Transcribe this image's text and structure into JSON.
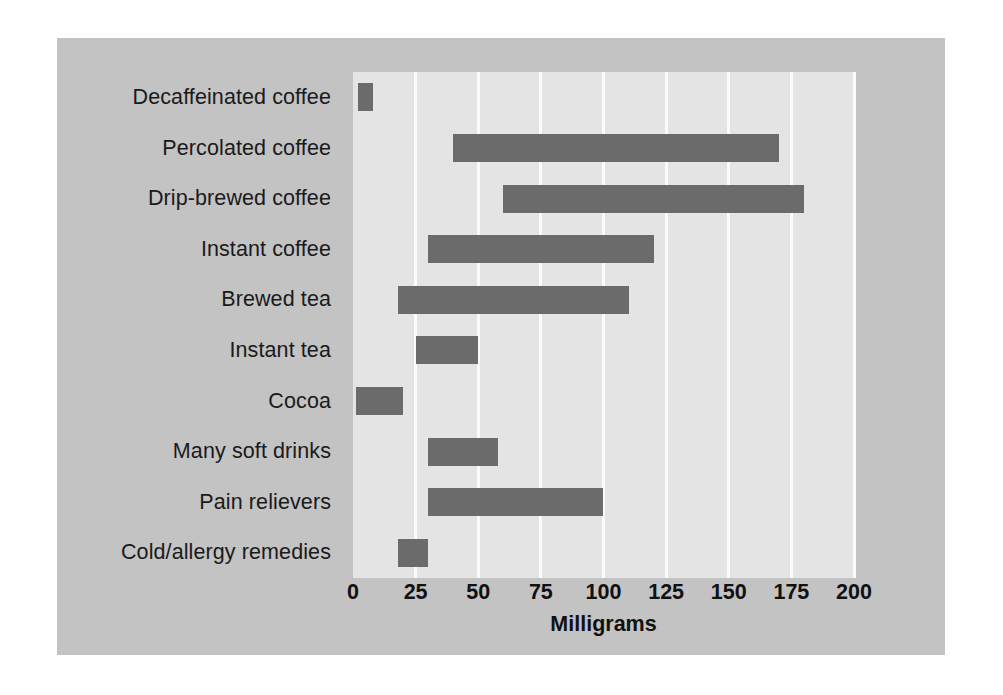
{
  "chart_data": {
    "type": "bar",
    "orientation": "horizontal",
    "bar_style": "range",
    "title": "",
    "xlabel": "Milligrams",
    "ylabel": "",
    "xlim": [
      0,
      200
    ],
    "xticks": [
      0,
      25,
      50,
      75,
      100,
      125,
      150,
      175,
      200
    ],
    "xtick_labels": [
      "0",
      "25",
      "50",
      "75",
      "100",
      "125",
      "150",
      "175",
      "200"
    ],
    "grid": "vertical",
    "legend": "none",
    "categories": [
      "Decaffeinated coffee",
      "Percolated coffee",
      "Drip-brewed coffee",
      "Instant coffee",
      "Brewed tea",
      "Instant tea",
      "Cocoa",
      "Many soft drinks",
      "Pain relievers",
      "Cold/allergy remedies"
    ],
    "ranges": [
      {
        "label": "Decaffeinated coffee",
        "low": 2,
        "high": 8
      },
      {
        "label": "Percolated coffee",
        "low": 40,
        "high": 170
      },
      {
        "label": "Drip-brewed coffee",
        "low": 60,
        "high": 180
      },
      {
        "label": "Instant coffee",
        "low": 30,
        "high": 120
      },
      {
        "label": "Brewed tea",
        "low": 18,
        "high": 110
      },
      {
        "label": "Instant tea",
        "low": 25,
        "high": 50
      },
      {
        "label": "Cocoa",
        "low": 1,
        "high": 20
      },
      {
        "label": "Many soft drinks",
        "low": 30,
        "high": 58
      },
      {
        "label": "Pain relievers",
        "low": 30,
        "high": 100
      },
      {
        "label": "Cold/allergy remedies",
        "low": 18,
        "high": 30
      }
    ],
    "colors": {
      "bar": "#6b6b6b",
      "plot_background": "#e4e4e4",
      "figure_background": "#c3c3c3",
      "gridline": "#fbfbfb",
      "text": "#111111",
      "page_background": "#ffffff"
    }
  }
}
